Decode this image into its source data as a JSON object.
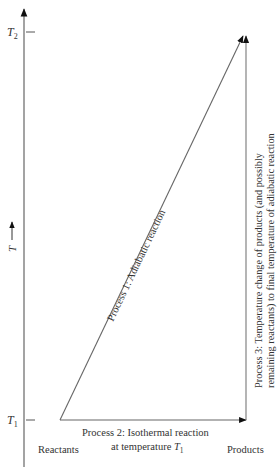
{
  "diagram": {
    "axis": {
      "label": "T",
      "ticks": [
        {
          "label": "T",
          "subscript": "2",
          "name": "T2"
        },
        {
          "label": "T",
          "subscript": "1",
          "name": "T1"
        }
      ]
    },
    "states": {
      "reactants": "Reactants",
      "products": "Products"
    },
    "processes": [
      {
        "id": 1,
        "label": "Process 1:  Adiabatic reaction"
      },
      {
        "id": 2,
        "line1": "Process 2:  Isothermal reaction",
        "line2_prefix": "at temperature ",
        "line2_var": "T",
        "line2_sub": "1"
      },
      {
        "id": 3,
        "line1": "Process 3:  Temperature change of products (and possibly",
        "line2": "remaining reactants) to final temperature of adiabatic reaction"
      }
    ],
    "colors": {
      "line": "#555555",
      "arrowhead": "#111111",
      "text": "#333333"
    }
  }
}
